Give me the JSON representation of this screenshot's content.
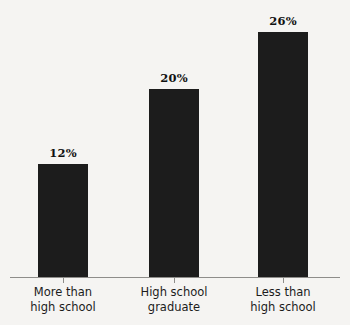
{
  "chart_data": {
    "type": "bar",
    "title": "",
    "subtitle": "",
    "xlabel": "",
    "ylabel": "",
    "grid": false,
    "legend": false,
    "orientation": "vertical",
    "ylim": [
      0,
      30
    ],
    "categories": [
      "More than high school",
      "High school graduate",
      "Less than high school"
    ],
    "category_lines": [
      [
        "More than",
        "high school"
      ],
      [
        "High school",
        "graduate"
      ],
      [
        "Less than",
        "high school"
      ]
    ],
    "values": [
      12,
      20,
      26
    ],
    "value_labels": [
      "12%",
      "20%",
      "26%"
    ],
    "units": "percent",
    "colors": {
      "background": "#f5f4f2",
      "bar": "#1c1c1c",
      "axis": "#8e8d8a",
      "label_text": "#1c1c1c",
      "value_text": "#111111"
    }
  }
}
